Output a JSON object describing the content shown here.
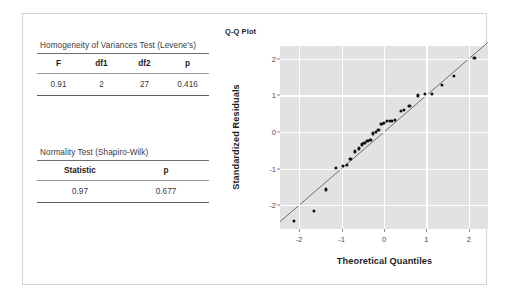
{
  "document": {
    "title": "Statistical Assumption Checks Output"
  },
  "tables": [
    {
      "id": "levene",
      "caption": "Homogeneity of Variances Test (Levene's)",
      "headers": [
        "F",
        "df1",
        "df2",
        "p"
      ],
      "rows": [
        [
          "0.91",
          "2",
          "27",
          "0.416"
        ]
      ]
    },
    {
      "id": "shapiro",
      "caption": "Normality Test (Shapiro-Wilk)",
      "headers": [
        "Statistic",
        "p"
      ],
      "rows": [
        [
          "0.97",
          "0.677"
        ]
      ]
    }
  ],
  "chart_data": {
    "type": "scatter",
    "title": "Q-Q Plot",
    "xlabel": "Theoretical Quantiles",
    "ylabel": "Standardized Residuals",
    "xlim": [
      -2.45,
      2.45
    ],
    "ylim": [
      -2.65,
      2.35
    ],
    "xticks": [
      -2,
      -1,
      0,
      1,
      2
    ],
    "xticklabels": [
      "-2",
      "-1",
      "0",
      "1",
      "2"
    ],
    "yticks": [
      -2,
      -1,
      0,
      1,
      2
    ],
    "yticklabels": [
      "-2",
      "-1",
      "0",
      "1",
      "2"
    ],
    "grid": true,
    "legend": "none",
    "panel_background": "#e2e2e2",
    "gridline_color": "#ffffff",
    "point_color": "#111111",
    "line_color": "#6f6f6f",
    "n_points": 30,
    "reference_line": {
      "slope": 1.0,
      "intercept": 0.0
    },
    "points": [
      {
        "x": -2.13,
        "y": -2.43
      },
      {
        "x": -1.64,
        "y": -2.15
      },
      {
        "x": -1.36,
        "y": -1.57
      },
      {
        "x": -1.14,
        "y": -0.97
      },
      {
        "x": -0.96,
        "y": -0.92
      },
      {
        "x": -0.87,
        "y": -0.9
      },
      {
        "x": -0.79,
        "y": -0.74
      },
      {
        "x": -0.68,
        "y": -0.53
      },
      {
        "x": -0.6,
        "y": -0.45
      },
      {
        "x": -0.53,
        "y": -0.34
      },
      {
        "x": -0.46,
        "y": -0.29
      },
      {
        "x": -0.39,
        "y": -0.24
      },
      {
        "x": -0.32,
        "y": -0.22
      },
      {
        "x": -0.26,
        "y": -0.04
      },
      {
        "x": -0.19,
        "y": 0.0
      },
      {
        "x": -0.13,
        "y": 0.05
      },
      {
        "x": -0.06,
        "y": 0.21
      },
      {
        "x": 0.0,
        "y": 0.25
      },
      {
        "x": 0.06,
        "y": 0.29
      },
      {
        "x": 0.13,
        "y": 0.3
      },
      {
        "x": 0.19,
        "y": 0.31
      },
      {
        "x": 0.26,
        "y": 0.33
      },
      {
        "x": 0.39,
        "y": 0.58
      },
      {
        "x": 0.46,
        "y": 0.6
      },
      {
        "x": 0.6,
        "y": 0.7
      },
      {
        "x": 0.79,
        "y": 1.0
      },
      {
        "x": 0.96,
        "y": 1.05
      },
      {
        "x": 1.14,
        "y": 1.05
      },
      {
        "x": 1.36,
        "y": 1.29
      },
      {
        "x": 1.64,
        "y": 1.52
      },
      {
        "x": 2.13,
        "y": 2.02
      }
    ]
  }
}
